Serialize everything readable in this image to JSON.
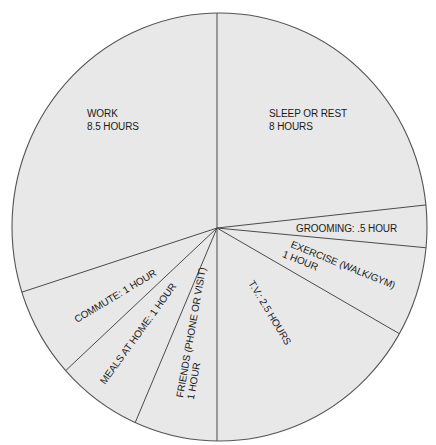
{
  "chart_data": {
    "type": "pie",
    "title": "",
    "unit": "hours",
    "categories": [
      "Sleep or Rest",
      "Grooming",
      "Exercise (Walk/Gym)",
      "T.V.",
      "Friends (Phone or Visit)",
      "Meals at Home",
      "Commute",
      "Work"
    ],
    "values": [
      8,
      0.5,
      1,
      2.5,
      1,
      1,
      1,
      8.5
    ],
    "start_angle_deg": 0,
    "direction": "clockwise",
    "legend": "none (labels inside slices)",
    "slice_boundaries_deg": [
      0,
      83.7,
      95.4,
      120.1,
      180,
      202.8,
      226.7,
      251.8,
      360
    ],
    "fill_color": "#e8e8e8",
    "edge_color": "#4a4a4a"
  },
  "labels": {
    "sleep": {
      "line1": "SLEEP OR REST",
      "line2": "8 HOURS"
    },
    "grooming": {
      "line1": "GROOMING: .5 HOUR"
    },
    "exercise": {
      "line1": "EXERCISE (WALK/GYM)",
      "line2": "1 HOUR"
    },
    "tv": {
      "line1": "T.V.: 2.5 HOURS"
    },
    "friends": {
      "line1": "FRIENDS (PHONE OR VISIT)",
      "line2": "1 HOUR"
    },
    "meals": {
      "line1": "MEALS AT HOME: 1 HOUR"
    },
    "commute": {
      "line1": "COMMUTE: 1 HOUR"
    },
    "work": {
      "line1": "WORK",
      "line2": "8.5 HOURS"
    }
  }
}
